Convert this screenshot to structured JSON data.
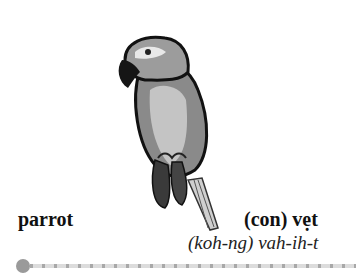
{
  "card": {
    "illustration": "parrot-illustration",
    "english_word": "parrot",
    "vietnamese_word": "(con) vẹt",
    "pronunciation": "(koh-ng) vah-ih-t",
    "colors": {
      "text": "#111111",
      "progress_dot": "#9a9a9a",
      "progress_line": "#dcdcdc"
    }
  }
}
